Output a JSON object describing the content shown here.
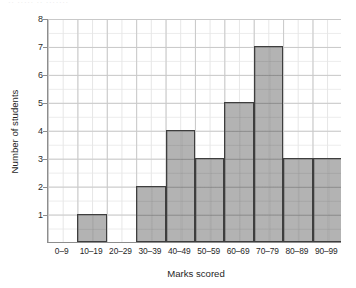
{
  "scan_artifact_text": "·· ····· ·· ·······",
  "chart_data": {
    "type": "bar",
    "title": "",
    "xlabel": "Marks scored",
    "ylabel": "Number of students",
    "categories": [
      "0–9",
      "10–19",
      "20–29",
      "30–39",
      "40–49",
      "50–59",
      "60–69",
      "70–79",
      "80–89",
      "90–99"
    ],
    "values": [
      0,
      1,
      0,
      2,
      4,
      3,
      5,
      7,
      3,
      3
    ],
    "ylim": [
      0,
      8
    ],
    "yticks": [
      8,
      7,
      6,
      5,
      4,
      3,
      2,
      1
    ],
    "ytick_labels": [
      "8",
      "7",
      "6",
      "5",
      "4",
      "3",
      "2",
      "1"
    ],
    "grid": true,
    "minor_grid": true,
    "legend": null,
    "bar_fill_color": "#969696",
    "bar_border_color": "#3e3e3e",
    "grid_color": "#c9c9c9",
    "minor_grid_color": "#e6e6e6",
    "axis_color": "#8d8d8d",
    "text_color": "#1f1f1f"
  }
}
